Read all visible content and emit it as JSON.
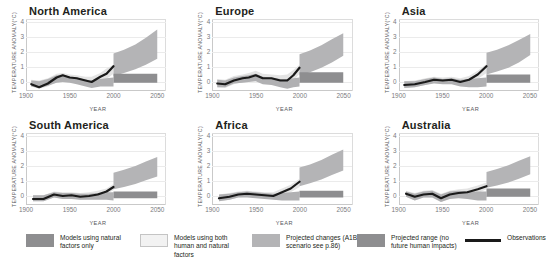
{
  "chart_data": {
    "type": "area",
    "xlabel": "YEAR",
    "ylabel": "TEMPERATURE ANOMALY(°C)",
    "xlim": [
      1900,
      2060
    ],
    "ylim": [
      -0.6,
      4.2
    ],
    "xticks": [
      "1900",
      "1950",
      "2000",
      "2050"
    ],
    "xtick_values": [
      1900,
      1950,
      2000,
      2050
    ],
    "yticks": [
      "0",
      "1",
      "2",
      "3",
      "4"
    ],
    "ytick_values": [
      0,
      1,
      2,
      3,
      4
    ],
    "grid": true,
    "legend_position": "bottom",
    "units": "degrees Celsius anomaly",
    "observation_period": [
      1906,
      2000
    ],
    "projection_period": [
      2000,
      2050
    ],
    "panels": [
      {
        "name": "North America",
        "observations": {
          "x": [
            1906,
            1915,
            1925,
            1935,
            1942,
            1950,
            1958,
            1968,
            1975,
            1985,
            1992,
            2000
          ],
          "y": [
            -0.15,
            -0.35,
            -0.1,
            0.3,
            0.45,
            0.3,
            0.25,
            0.1,
            0.0,
            0.35,
            0.55,
            1.05
          ]
        },
        "human_and_natural_band": {
          "upper": [
            0.15,
            0.1,
            0.25,
            0.55,
            0.6,
            0.5,
            0.45,
            0.35,
            0.35,
            0.6,
            0.9,
            1.15
          ],
          "lower": [
            -0.3,
            -0.45,
            -0.3,
            0.0,
            0.1,
            0.05,
            -0.05,
            -0.15,
            -0.3,
            0.0,
            0.2,
            0.55
          ]
        },
        "natural_only_band": {
          "upper": [
            0.1,
            0.05,
            0.2,
            0.45,
            0.5,
            0.35,
            0.3,
            0.15,
            0.1,
            0.2,
            0.25,
            0.3
          ],
          "lower": [
            -0.3,
            -0.4,
            -0.25,
            -0.05,
            0.0,
            -0.05,
            -0.15,
            -0.3,
            -0.4,
            -0.3,
            -0.3,
            -0.3
          ]
        },
        "projected_changes": {
          "x": [
            2000,
            2012,
            2025,
            2037,
            2050
          ],
          "upper": [
            1.9,
            2.15,
            2.5,
            2.95,
            3.5
          ],
          "lower": [
            0.4,
            0.6,
            0.85,
            1.15,
            1.55
          ]
        },
        "projected_no_human": {
          "x": [
            2000,
            2050
          ],
          "upper": [
            0.55,
            0.55
          ],
          "lower": [
            -0.05,
            -0.05
          ]
        }
      },
      {
        "name": "Europe",
        "observations": {
          "x": [
            1906,
            1915,
            1925,
            1935,
            1942,
            1950,
            1958,
            1968,
            1978,
            1986,
            1993,
            2000
          ],
          "y": [
            -0.1,
            -0.15,
            0.1,
            0.25,
            0.3,
            0.45,
            0.25,
            0.25,
            0.1,
            0.1,
            0.45,
            0.95
          ]
        },
        "human_and_natural_band": {
          "upper": [
            0.2,
            0.15,
            0.4,
            0.5,
            0.6,
            0.75,
            0.55,
            0.5,
            0.45,
            0.5,
            0.8,
            1.15
          ],
          "lower": [
            -0.35,
            -0.4,
            -0.15,
            0.0,
            0.05,
            0.15,
            -0.05,
            -0.1,
            -0.25,
            -0.25,
            0.1,
            0.55
          ]
        },
        "natural_only_band": {
          "upper": [
            0.15,
            0.1,
            0.3,
            0.4,
            0.45,
            0.55,
            0.35,
            0.3,
            0.2,
            0.2,
            0.25,
            0.3
          ],
          "lower": [
            -0.35,
            -0.35,
            -0.1,
            -0.05,
            0.0,
            0.05,
            -0.15,
            -0.2,
            -0.35,
            -0.45,
            -0.35,
            -0.3
          ]
        },
        "projected_changes": {
          "x": [
            2000,
            2012,
            2025,
            2037,
            2050
          ],
          "upper": [
            1.85,
            2.1,
            2.45,
            2.85,
            3.25
          ],
          "lower": [
            0.45,
            0.65,
            0.95,
            1.3,
            1.75
          ]
        },
        "projected_no_human": {
          "x": [
            2000,
            2050
          ],
          "upper": [
            0.65,
            0.65
          ],
          "lower": [
            -0.05,
            -0.05
          ]
        }
      },
      {
        "name": "Asia",
        "observations": {
          "x": [
            1906,
            1918,
            1930,
            1940,
            1950,
            1960,
            1970,
            1980,
            1990,
            2000
          ],
          "y": [
            -0.2,
            -0.15,
            0.0,
            0.15,
            0.1,
            0.15,
            0.0,
            0.15,
            0.5,
            1.05
          ]
        },
        "human_and_natural_band": {
          "upper": [
            0.05,
            0.1,
            0.25,
            0.35,
            0.3,
            0.35,
            0.25,
            0.4,
            0.75,
            1.2
          ],
          "lower": [
            -0.4,
            -0.35,
            -0.2,
            -0.05,
            -0.1,
            -0.1,
            -0.25,
            -0.1,
            0.2,
            0.6
          ]
        },
        "natural_only_band": {
          "upper": [
            0.05,
            0.05,
            0.2,
            0.3,
            0.2,
            0.25,
            0.15,
            0.2,
            0.25,
            0.3
          ],
          "lower": [
            -0.4,
            -0.35,
            -0.2,
            -0.1,
            -0.15,
            -0.15,
            -0.3,
            -0.35,
            -0.35,
            -0.3
          ]
        },
        "projected_changes": {
          "x": [
            2000,
            2012,
            2025,
            2037,
            2050
          ],
          "upper": [
            1.95,
            2.15,
            2.45,
            2.8,
            3.2
          ],
          "lower": [
            0.5,
            0.7,
            0.95,
            1.3,
            1.8
          ]
        },
        "projected_no_human": {
          "x": [
            2000,
            2050
          ],
          "upper": [
            0.5,
            0.5
          ],
          "lower": [
            -0.05,
            -0.05
          ]
        }
      },
      {
        "name": "South America",
        "observations": {
          "x": [
            1908,
            1920,
            1932,
            1942,
            1952,
            1962,
            1972,
            1982,
            1992,
            2000
          ],
          "y": [
            -0.2,
            -0.2,
            0.1,
            0.0,
            0.05,
            -0.05,
            0.0,
            0.1,
            0.3,
            0.6
          ]
        },
        "human_and_natural_band": {
          "upper": [
            0.05,
            0.05,
            0.3,
            0.25,
            0.25,
            0.2,
            0.25,
            0.35,
            0.5,
            0.8
          ],
          "lower": [
            -0.35,
            -0.35,
            -0.1,
            -0.2,
            -0.15,
            -0.25,
            -0.2,
            -0.1,
            0.1,
            0.4
          ]
        },
        "natural_only_band": {
          "upper": [
            0.05,
            0.05,
            0.25,
            0.2,
            0.2,
            0.15,
            0.15,
            0.2,
            0.25,
            0.25
          ],
          "lower": [
            -0.35,
            -0.35,
            -0.1,
            -0.2,
            -0.2,
            -0.25,
            -0.25,
            -0.25,
            -0.25,
            -0.3
          ]
        },
        "projected_changes": {
          "x": [
            2000,
            2012,
            2025,
            2037,
            2050
          ],
          "upper": [
            1.55,
            1.75,
            2.0,
            2.3,
            2.6
          ],
          "lower": [
            0.45,
            0.6,
            0.8,
            1.05,
            1.3
          ]
        },
        "projected_no_human": {
          "x": [
            2000,
            2050
          ],
          "upper": [
            0.3,
            0.3
          ],
          "lower": [
            -0.15,
            -0.15
          ]
        }
      },
      {
        "name": "Africa",
        "observations": {
          "x": [
            1908,
            1920,
            1930,
            1940,
            1950,
            1960,
            1970,
            1980,
            1990,
            2000
          ],
          "y": [
            -0.15,
            -0.05,
            0.1,
            0.15,
            0.1,
            0.05,
            0.0,
            0.25,
            0.5,
            0.95
          ]
        },
        "human_and_natural_band": {
          "upper": [
            0.1,
            0.2,
            0.3,
            0.35,
            0.3,
            0.25,
            0.25,
            0.5,
            0.75,
            1.15
          ],
          "lower": [
            -0.35,
            -0.25,
            -0.1,
            -0.05,
            -0.1,
            -0.15,
            -0.2,
            0.0,
            0.25,
            0.6
          ]
        },
        "natural_only_band": {
          "upper": [
            0.1,
            0.15,
            0.25,
            0.3,
            0.25,
            0.2,
            0.15,
            0.2,
            0.25,
            0.3
          ],
          "lower": [
            -0.35,
            -0.25,
            -0.1,
            -0.1,
            -0.15,
            -0.2,
            -0.25,
            -0.3,
            -0.3,
            -0.3
          ]
        },
        "projected_changes": {
          "x": [
            2000,
            2012,
            2025,
            2037,
            2050
          ],
          "upper": [
            1.9,
            2.1,
            2.4,
            2.75,
            3.1
          ],
          "lower": [
            0.65,
            0.85,
            1.1,
            1.4,
            1.7
          ]
        },
        "projected_no_human": {
          "x": [
            2000,
            2050
          ],
          "upper": [
            0.35,
            0.35
          ],
          "lower": [
            -0.1,
            -0.1
          ]
        }
      },
      {
        "name": "Australia",
        "observations": {
          "x": [
            1908,
            1918,
            1928,
            1938,
            1948,
            1958,
            1968,
            1978,
            1990,
            2000
          ],
          "y": [
            0.15,
            -0.05,
            0.1,
            0.15,
            -0.15,
            0.1,
            0.2,
            0.25,
            0.45,
            0.65
          ]
        },
        "human_and_natural_band": {
          "upper": [
            0.35,
            0.2,
            0.35,
            0.4,
            0.15,
            0.35,
            0.45,
            0.5,
            0.7,
            0.9
          ],
          "lower": [
            -0.05,
            -0.3,
            -0.1,
            -0.1,
            -0.4,
            -0.15,
            -0.05,
            0.0,
            0.2,
            0.45
          ]
        },
        "natural_only_band": {
          "upper": [
            0.3,
            0.15,
            0.3,
            0.35,
            0.1,
            0.3,
            0.35,
            0.3,
            0.3,
            0.3
          ],
          "lower": [
            -0.05,
            -0.3,
            -0.1,
            -0.1,
            -0.4,
            -0.2,
            -0.15,
            -0.2,
            -0.3,
            -0.3
          ]
        },
        "projected_changes": {
          "x": [
            2000,
            2012,
            2025,
            2037,
            2050
          ],
          "upper": [
            1.6,
            1.8,
            2.05,
            2.35,
            2.65
          ],
          "lower": [
            0.55,
            0.7,
            0.9,
            1.15,
            1.45
          ]
        },
        "projected_no_human": {
          "x": [
            2000,
            2050
          ],
          "upper": [
            0.5,
            0.5
          ],
          "lower": [
            -0.05,
            -0.05
          ]
        }
      }
    ],
    "legend": [
      {
        "label": "Models using natural factors only",
        "swatch": "natural-only",
        "color": "#8e8e90"
      },
      {
        "label": "Models using both human and natural factors",
        "swatch": "human-and-natural",
        "color": "#eeeeee"
      },
      {
        "label": "Projected changes (A1B scenario see p.86)",
        "swatch": "projected-changes",
        "color": "#b4b4b6"
      },
      {
        "label": "Projected range (no future human impacts)",
        "swatch": "projected-range",
        "color": "#8e8e90"
      },
      {
        "label": "Observations",
        "swatch": "observations-line",
        "color": "#1a1a1a"
      }
    ]
  },
  "colors": {
    "band_human_natural": "#e4e4e4",
    "band_natural_only": "#b0b0b2",
    "projection_wedge": "#b4b4b6",
    "projection_flat": "#8e8e90",
    "observation_line": "#1a1a1a",
    "axis": "#c9c9c9",
    "tick_text": "#7a7a7d",
    "title_text": "#231f20"
  }
}
